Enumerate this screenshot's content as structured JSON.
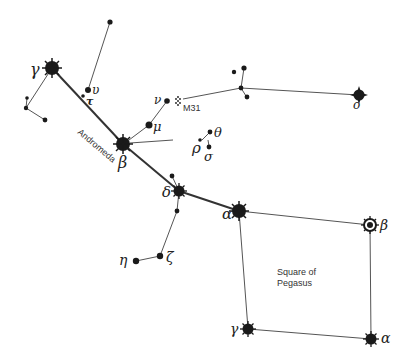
{
  "title": "Andromeda",
  "labels": {
    "constellation": "Andromeda",
    "asterism_line1": "Square of",
    "asterism_line2": "Pegasus",
    "galaxy": "M31"
  },
  "stars": [
    {
      "id": "gamma-and",
      "label": "γ",
      "x": 52,
      "y": 68,
      "type": "big"
    },
    {
      "id": "beta-and",
      "label": "β",
      "x": 123,
      "y": 144,
      "type": "big"
    },
    {
      "id": "delta-and",
      "label": "δ",
      "x": 179,
      "y": 191,
      "type": "big"
    },
    {
      "id": "alpha-and",
      "label": "α",
      "x": 239,
      "y": 211,
      "type": "big"
    },
    {
      "id": "beta-peg",
      "label": "β",
      "x": 370,
      "y": 225,
      "type": "ringed"
    },
    {
      "id": "alpha-peg",
      "label": "α",
      "x": 371,
      "y": 339,
      "type": "big"
    },
    {
      "id": "gamma-peg",
      "label": "γ",
      "x": 248,
      "y": 329,
      "type": "medium"
    },
    {
      "id": "upsilon-and",
      "label": "υ",
      "x": 88,
      "y": 90,
      "type": "small"
    },
    {
      "id": "tau-and",
      "label": "τ",
      "x": 83,
      "y": 96,
      "type": "tiny"
    },
    {
      "id": "nu-and",
      "label": "ν",
      "x": 167,
      "y": 101,
      "type": "small"
    },
    {
      "id": "mu-and",
      "label": "μ",
      "x": 149,
      "y": 125,
      "type": "small"
    },
    {
      "id": "rho-and",
      "label": "ρ",
      "x": 200,
      "y": 140,
      "type": "tiny"
    },
    {
      "id": "theta-and",
      "label": "θ",
      "x": 210,
      "y": 132,
      "type": "tiny"
    },
    {
      "id": "sigma-and",
      "label": "σ",
      "x": 209,
      "y": 147,
      "type": "tiny"
    },
    {
      "id": "omicron-and",
      "label": "ο",
      "x": 359,
      "y": 95,
      "type": "diamond"
    },
    {
      "id": "eta-and",
      "label": "η",
      "x": 136,
      "y": 261,
      "type": "small"
    },
    {
      "id": "zeta-and",
      "label": "ζ",
      "x": 160,
      "y": 256,
      "type": "small"
    }
  ],
  "colors": {
    "ink": "#1a1a1a",
    "line": "#555555",
    "background": "#ffffff"
  }
}
